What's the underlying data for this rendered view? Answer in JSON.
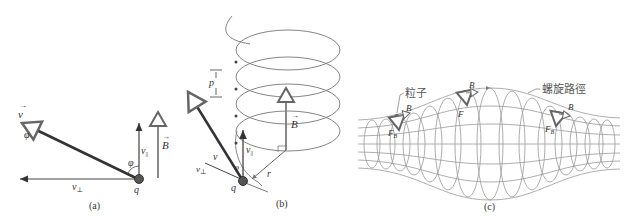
{
  "panels": {
    "a": {
      "caption": "(a)",
      "labels": {
        "v": "v",
        "phi_top": "φ",
        "phi_angle": "φ",
        "v_par": "v",
        "v_par_sub": "||",
        "v_perp": "v",
        "v_perp_sub": "⊥",
        "B": "B",
        "q": "q"
      }
    },
    "b": {
      "caption": "(b)",
      "labels": {
        "p": "p",
        "B": "B",
        "v": "v",
        "v_par": "v",
        "v_par_sub": "||",
        "v_perp": "v",
        "v_perp_sub": "⊥",
        "phi": "φ",
        "q": "q",
        "r": "r"
      }
    },
    "c": {
      "caption": "(c)",
      "labels": {
        "particle": "粒子",
        "spiral_path": "螺旋路徑",
        "B1": "B",
        "B2": "B",
        "B3": "B",
        "F": "F",
        "FB1": "F",
        "FB1_sub": "B",
        "FB3": "F",
        "FB3_sub": "B"
      }
    }
  },
  "colors": {
    "dark_vector": "#333333",
    "field": "#888888",
    "line": "#777777"
  }
}
